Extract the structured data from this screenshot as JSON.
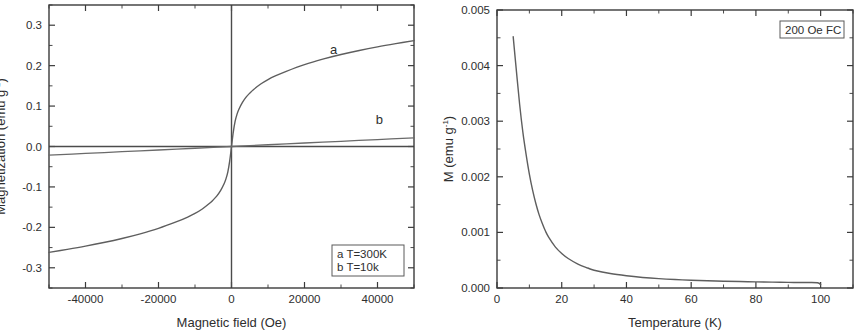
{
  "figure": {
    "background_color": "#ffffff",
    "line_color": "#6a6a6a",
    "axis_color": "#3b3b3b",
    "text_color": "#2e2e2e"
  },
  "chart_data": [
    {
      "panel": "left",
      "type": "line",
      "title": "",
      "xlabel": "Magnetic field (Oe)",
      "ylabel_main": "Magnetization (emu g",
      "ylabel_sup": "-1",
      "ylabel_close": ")",
      "ylabel": "Magnetization (emu g-1)",
      "xlim": [
        -50000,
        50000
      ],
      "ylim": [
        -0.35,
        0.35
      ],
      "xticks": [
        -40000,
        -20000,
        0,
        20000,
        40000
      ],
      "xticklabels": [
        "-40000",
        "-20000",
        "0",
        "20000",
        "40000"
      ],
      "yticks": [
        -0.3,
        -0.2,
        -0.1,
        0.0,
        0.1,
        0.2,
        0.3
      ],
      "yticklabels": [
        "-0.3",
        "-0.2",
        "-0.1",
        "0.0",
        "0.1",
        "0.2",
        "0.3"
      ],
      "x_minor_step": 10000,
      "y_minor_step": 0.05,
      "grid": false,
      "zero_lines": true,
      "legend_position": "bottom-right",
      "legend_entries": [
        "a T=300K",
        "b T=10k"
      ],
      "annotations": [
        {
          "text": "a",
          "x": 28000,
          "y": 0.228
        },
        {
          "text": "b",
          "x": 40500,
          "y": 0.055
        }
      ],
      "series": [
        {
          "name": "a",
          "label": "T=300K",
          "model": "langevin-like saturating hysteresis-free",
          "x": [
            -50000,
            -45000,
            -40000,
            -35000,
            -30000,
            -25000,
            -20000,
            -15000,
            -12000,
            -10000,
            -8000,
            -6000,
            -5000,
            -4000,
            -3000,
            -2000,
            -1500,
            -1000,
            -500,
            0,
            500,
            1000,
            1500,
            2000,
            3000,
            4000,
            5000,
            6000,
            8000,
            10000,
            12000,
            15000,
            20000,
            25000,
            30000,
            35000,
            40000,
            45000,
            50000
          ],
          "y": [
            -0.262,
            -0.2545,
            -0.2465,
            -0.2375,
            -0.2275,
            -0.216,
            -0.2025,
            -0.186,
            -0.1745,
            -0.1655,
            -0.1545,
            -0.1405,
            -0.132,
            -0.122,
            -0.109,
            -0.0915,
            -0.0795,
            -0.0625,
            -0.036,
            0.0,
            0.036,
            0.0625,
            0.0795,
            0.0915,
            0.109,
            0.122,
            0.132,
            0.1405,
            0.1545,
            0.1655,
            0.1745,
            0.186,
            0.2025,
            0.216,
            0.2275,
            0.2375,
            0.2465,
            0.2545,
            0.262
          ]
        },
        {
          "name": "b",
          "label": "T=10k",
          "model": "near-linear paramagnetic",
          "x": [
            -50000,
            -40000,
            -30000,
            -20000,
            -10000,
            0,
            10000,
            20000,
            30000,
            40000,
            50000
          ],
          "y": [
            -0.0215,
            -0.0172,
            -0.0129,
            -0.0086,
            -0.0043,
            0.0,
            0.0043,
            0.0086,
            0.0129,
            0.0172,
            0.0215
          ]
        }
      ]
    },
    {
      "panel": "right",
      "type": "line",
      "title": "",
      "xlabel": "Temperature (K)",
      "ylabel_main": "M (emu g",
      "ylabel_sup": "-1",
      "ylabel_close": ")",
      "ylabel": "M (emu g-1)",
      "xlim": [
        0,
        110
      ],
      "ylim": [
        0.0,
        0.005
      ],
      "xticks": [
        0,
        20,
        40,
        60,
        80,
        100
      ],
      "xticklabels": [
        "0",
        "20",
        "40",
        "60",
        "80",
        "100"
      ],
      "yticks": [
        0.0,
        0.001,
        0.002,
        0.003,
        0.004,
        0.005
      ],
      "yticklabels": [
        "0.000",
        "0.001",
        "0.002",
        "0.003",
        "0.004",
        "0.005"
      ],
      "x_minor_step": 10,
      "y_minor_step": 0.0005,
      "grid": false,
      "zero_lines": false,
      "legend_position": "top-right",
      "legend_entries": [
        "200 Oe FC"
      ],
      "annotations": [],
      "series": [
        {
          "name": "FC",
          "label": "200 Oe FC",
          "model": "Curie-Weiss decay",
          "x": [
            5,
            6,
            7,
            8,
            9,
            10,
            11,
            12,
            13,
            14,
            15,
            16,
            18,
            20,
            22,
            25,
            28,
            30,
            35,
            40,
            45,
            50,
            55,
            60,
            65,
            70,
            75,
            80,
            85,
            90,
            95,
            99,
            100
          ],
          "y": [
            0.00452,
            0.0039,
            0.0033,
            0.0028,
            0.0024,
            0.00205,
            0.00176,
            0.00152,
            0.00132,
            0.00116,
            0.00102,
            0.00091,
            0.00074,
            0.00062,
            0.00053,
            0.00043,
            0.00036,
            0.00032,
            0.00026,
            0.00022,
            0.00019,
            0.000168,
            0.000152,
            0.00014,
            0.00013,
            0.000122,
            0.000116,
            0.00011,
            0.000105,
            0.000101,
            9.8e-05,
            9.5e-05,
            6e-05
          ]
        }
      ]
    }
  ]
}
